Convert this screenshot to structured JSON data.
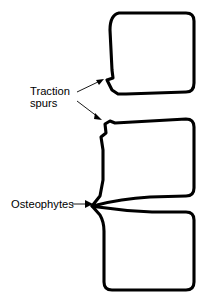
{
  "figure": {
    "background_color": "#ffffff",
    "line_color": "#000000",
    "canvas": {
      "width": 213,
      "height": 306
    }
  },
  "labels": {
    "traction_spurs": {
      "line1": "Traction",
      "line2": "spurs",
      "x": 30,
      "y_line1": 95,
      "y_line2": 107,
      "pointer_count": 2
    },
    "osteophytes": {
      "text": "Osteophytes",
      "x": 11,
      "y": 208,
      "pointer_count": 1
    }
  },
  "structures": [
    {
      "name": "upper-vertebral-body",
      "feature": "traction spur at anteroinferior corner",
      "bounds": {
        "x": 107,
        "y": 12,
        "width": 88,
        "height": 84
      }
    },
    {
      "name": "middle-vertebral-body",
      "feature": "traction spur at anterosuperior corner; osteophyte at anteroinferior corner",
      "bounds": {
        "x": 98,
        "y": 114,
        "width": 97,
        "height": 92
      }
    },
    {
      "name": "lower-vertebral-body",
      "feature": "osteophyte at anterosuperior corner",
      "bounds": {
        "x": 100,
        "y": 203,
        "width": 95,
        "height": 88
      }
    }
  ],
  "annotations": {
    "arrow_upper": {
      "from_x": 76,
      "from_y": 92,
      "to_x": 103,
      "to_y": 80
    },
    "arrow_lower": {
      "from_x": 76,
      "from_y": 102,
      "to_x": 101,
      "to_y": 120
    },
    "arrow_osteophyte": {
      "from_x": 72,
      "from_y": 204,
      "to_x": 93,
      "to_y": 204
    }
  }
}
